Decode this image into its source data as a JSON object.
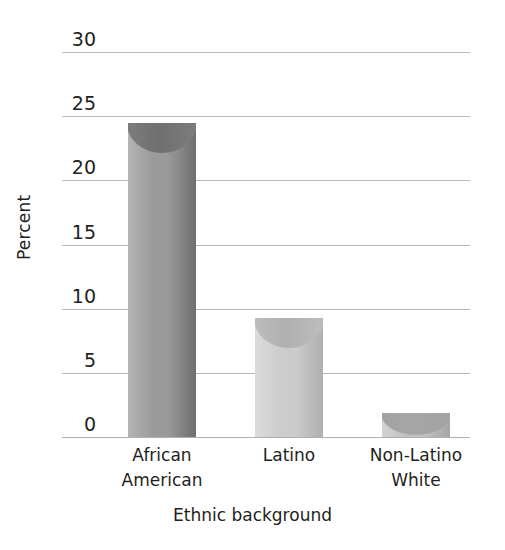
{
  "chart_data": {
    "type": "bar",
    "title": "",
    "categories": [
      "African American",
      "Latino",
      "Non-Latino White"
    ],
    "category_lines": [
      [
        "African",
        "American"
      ],
      [
        "Latino",
        ""
      ],
      [
        "Non-Latino",
        "White"
      ]
    ],
    "values": [
      24.5,
      9.3,
      1.9
    ],
    "xlabel": "Ethnic background",
    "ylabel": "Percent",
    "ylim": [
      0,
      30
    ],
    "ytick_values": [
      30,
      25,
      20,
      15,
      10,
      5,
      0
    ],
    "ytick_labels": [
      "30",
      "25",
      "20",
      "15",
      "10",
      "5",
      "0"
    ],
    "grid": true,
    "legend": "none",
    "series": [
      {
        "name": "Percent",
        "values": [
          24.5,
          9.3,
          1.9
        ],
        "bar_colors": [
          "#969696",
          "#c9c9c9",
          "#bdbdbd"
        ]
      }
    ]
  },
  "axes": {
    "y_title": "Percent",
    "x_title": "Ethnic background",
    "y_ticks": [
      {
        "label": "30",
        "value": 30
      },
      {
        "label": "25",
        "value": 25
      },
      {
        "label": "20",
        "value": 20
      },
      {
        "label": "15",
        "value": 15
      },
      {
        "label": "10",
        "value": 10
      },
      {
        "label": "5",
        "value": 5
      },
      {
        "label": "0",
        "value": 0
      }
    ]
  },
  "bars": [
    {
      "category_line1": "African",
      "category_line2": "American",
      "value": 24.5,
      "color_light": "#b4b4b4",
      "color_mid": "#9a9a9a",
      "color_dark": "#6f6f6f",
      "cap_color": "#7d7d7d"
    },
    {
      "category_line1": "Latino",
      "category_line2": "",
      "value": 9.3,
      "color_light": "#dcdcdc",
      "color_mid": "#cccccc",
      "color_dark": "#b0b0b0",
      "cap_color": "#bdbdbd"
    },
    {
      "category_line1": "Non-Latino",
      "category_line2": "White",
      "value": 1.9,
      "color_light": "#d2d2d2",
      "color_mid": "#c2c2c2",
      "color_dark": "#a6a6a6",
      "cap_color": "#a2a2a2"
    }
  ],
  "colors": {
    "background": "#ffffff",
    "gridline": "#b8b8b8",
    "text": "#231f20"
  }
}
